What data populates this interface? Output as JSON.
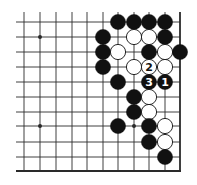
{
  "diagram": {
    "type": "go-board-fragment",
    "background": "#ffffff",
    "line_color": "#2a2a2a",
    "black_color": "#111111",
    "white_color": "#ffffff",
    "grid": {
      "col_x": [
        24,
        40,
        56,
        72,
        87,
        103,
        118,
        134,
        149,
        165,
        180
      ],
      "row_y": [
        22,
        37,
        52,
        67,
        82,
        97,
        112,
        126,
        142,
        157,
        171
      ],
      "line_start_x": 16,
      "line_start_y": 12,
      "right_edge": true,
      "bottom_edge": true,
      "stone_radius": 7.6
    },
    "hoshi": [
      {
        "col": 1,
        "row": 1
      },
      {
        "col": 1,
        "row": 7
      },
      {
        "col": 7,
        "row": 7
      }
    ],
    "stones": [
      {
        "color": "black",
        "col": 6,
        "row": 0
      },
      {
        "color": "black",
        "col": 7,
        "row": 0
      },
      {
        "color": "black",
        "col": 8,
        "row": 0
      },
      {
        "color": "black",
        "col": 9,
        "row": 0
      },
      {
        "color": "black",
        "col": 5,
        "row": 1
      },
      {
        "color": "white",
        "col": 7,
        "row": 1
      },
      {
        "color": "white",
        "col": 8,
        "row": 1
      },
      {
        "color": "black",
        "col": 9,
        "row": 1
      },
      {
        "color": "black",
        "col": 5,
        "row": 2
      },
      {
        "color": "white",
        "col": 6,
        "row": 2
      },
      {
        "color": "black",
        "col": 8,
        "row": 2
      },
      {
        "color": "white",
        "col": 9,
        "row": 2
      },
      {
        "color": "black",
        "col": 10,
        "row": 2
      },
      {
        "color": "black",
        "col": 5,
        "row": 3
      },
      {
        "color": "white",
        "col": 7,
        "row": 3
      },
      {
        "color": "white",
        "col": 8,
        "row": 3,
        "label": "2"
      },
      {
        "color": "white",
        "col": 9,
        "row": 3
      },
      {
        "color": "black",
        "col": 6,
        "row": 4
      },
      {
        "color": "black",
        "col": 8,
        "row": 4,
        "label": "3"
      },
      {
        "color": "black",
        "col": 9,
        "row": 4,
        "label": "1"
      },
      {
        "color": "black",
        "col": 7,
        "row": 5
      },
      {
        "color": "white",
        "col": 8,
        "row": 5
      },
      {
        "color": "black",
        "col": 7,
        "row": 6
      },
      {
        "color": "white",
        "col": 8,
        "row": 6
      },
      {
        "color": "black",
        "col": 6,
        "row": 7
      },
      {
        "color": "black",
        "col": 8,
        "row": 7
      },
      {
        "color": "white",
        "col": 9,
        "row": 7
      },
      {
        "color": "black",
        "col": 8,
        "row": 8
      },
      {
        "color": "white",
        "col": 9,
        "row": 8
      },
      {
        "color": "black",
        "col": 9,
        "row": 9
      }
    ],
    "move_labels": [
      "1",
      "2",
      "3"
    ]
  }
}
